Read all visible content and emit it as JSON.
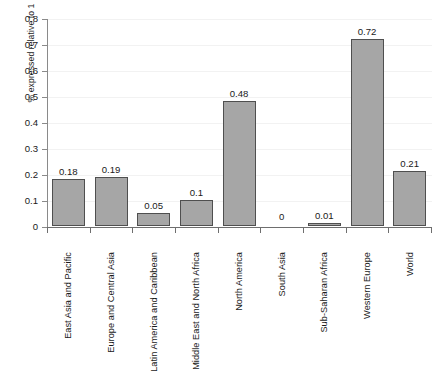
{
  "chart_data": {
    "type": "bar",
    "title": "",
    "subtitle": "",
    "xlabel": "",
    "ylabel": "% expressed relative to 1",
    "ylim": [
      0,
      0.8
    ],
    "ytick_labels": [
      "0.8",
      "0.7",
      "0.6",
      "0.5",
      "0.4",
      "0.3",
      "0.2",
      "0.1",
      "0"
    ],
    "ytick_values": [
      0.8,
      0.7,
      0.6,
      0.5,
      0.4,
      0.3,
      0.2,
      0.1,
      0
    ],
    "grid": true,
    "legend": null,
    "legend_position": "none",
    "bar_color": "#a6a6a6",
    "bar_border_color": "#4f4f4f",
    "axis_color": "#6e6e6e",
    "categories": [
      "East Asia and Pacific",
      "Europe and Central Asia",
      "Latin America and Caribbean",
      "Middle East and North Africa",
      "North America",
      "South Asia",
      "Sub-Saharan Africa",
      "Western Europe",
      "World"
    ],
    "values": [
      0.18,
      0.19,
      0.05,
      0.1,
      0.48,
      0,
      0.01,
      0.72,
      0.21
    ],
    "data_labels": [
      "0.18",
      "0.19",
      "0.05",
      "0.1",
      "0.48",
      "0",
      "0.01",
      "0.72",
      "0.21"
    ]
  }
}
